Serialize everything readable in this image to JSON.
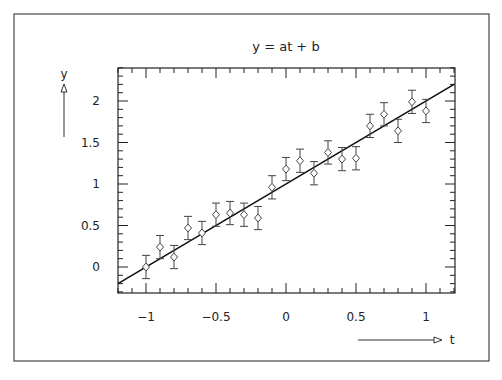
{
  "chart_data": {
    "type": "scatter",
    "title": "y = at + b",
    "xlabel": "t",
    "ylabel": "y",
    "xlim": [
      -1.2,
      1.2
    ],
    "ylim": [
      -0.31,
      2.4
    ],
    "xticks": [
      -1,
      -0.5,
      0,
      0.5,
      1
    ],
    "xtick_labels": [
      "−1",
      "−0.5",
      "0",
      "0.5",
      "1"
    ],
    "yticks": [
      0,
      0.5,
      1,
      1.5,
      2
    ],
    "ytick_labels": [
      "0",
      "0.5",
      "1",
      "1.5",
      "2"
    ],
    "grid": false,
    "legend": null,
    "series": [
      {
        "name": "data",
        "marker": "diamond-open",
        "error_bar": 0.14,
        "x": [
          -1.0,
          -0.9,
          -0.8,
          -0.7,
          -0.6,
          -0.5,
          -0.4,
          -0.3,
          -0.2,
          -0.1,
          0.0,
          0.1,
          0.2,
          0.3,
          0.4,
          0.5,
          0.6,
          0.7,
          0.8,
          0.9,
          1.0
        ],
        "y": [
          0.0,
          0.24,
          0.12,
          0.47,
          0.41,
          0.63,
          0.65,
          0.63,
          0.59,
          0.96,
          1.18,
          1.28,
          1.13,
          1.38,
          1.3,
          1.31,
          1.7,
          1.84,
          1.64,
          1.99,
          1.88
        ]
      },
      {
        "name": "fit",
        "type": "line",
        "slope": 1.0,
        "intercept": 1.0,
        "x": [
          -1.2,
          1.2
        ],
        "y": [
          -0.2,
          2.2
        ]
      }
    ]
  }
}
